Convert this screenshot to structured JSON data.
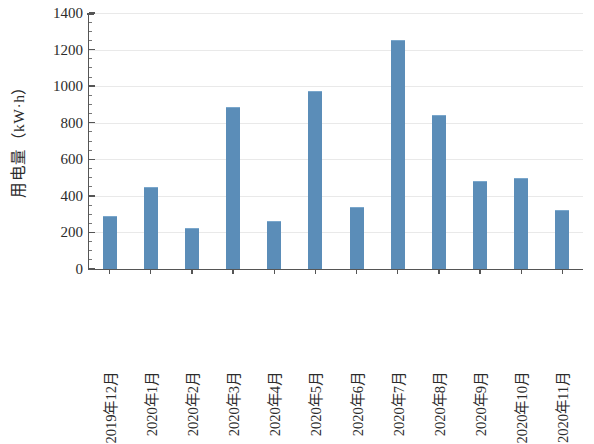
{
  "chart_data": {
    "type": "bar",
    "title": "",
    "xlabel": "",
    "ylabel": "用电量（kW·h）",
    "categories": [
      "2019年12月",
      "2020年1月",
      "2020年2月",
      "2020年3月",
      "2020年4月",
      "2020年5月",
      "2020年6月",
      "2020年7月",
      "2020年8月",
      "2020年9月",
      "2020年10月",
      "2020年11月"
    ],
    "values": [
      285,
      443,
      219,
      880,
      257,
      968,
      334,
      1245,
      838,
      478,
      492,
      315
    ],
    "ylim": [
      0,
      1400
    ],
    "ytick_labels": [
      "0",
      "200",
      "400",
      "600",
      "800",
      "1000",
      "1200",
      "1400"
    ],
    "ytick_values": [
      0,
      200,
      400,
      600,
      800,
      1000,
      1200,
      1400
    ],
    "ytick_minor_step": 50,
    "grid": true,
    "grid_axis": "y",
    "legend": null,
    "legend_position": "none",
    "series_color": "#5b8db8",
    "axis_color": "#555555",
    "grid_color": "#e9e9e9",
    "background": "#ffffff"
  }
}
